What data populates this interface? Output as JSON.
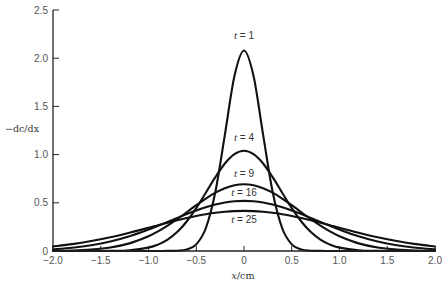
{
  "chart_data": {
    "type": "line",
    "title": "",
    "xlabel": "x/cm",
    "ylabel": "−dc/dx",
    "xlim": [
      -2.0,
      2.0
    ],
    "ylim": [
      0,
      2.5
    ],
    "grid": false,
    "legend": "none (curves labelled inline)",
    "x_ticks": [
      -2.0,
      -1.5,
      -1.0,
      -0.5,
      0,
      0.5,
      1.0,
      1.5,
      2.0
    ],
    "x_tick_labels": [
      "−2.0",
      "−1.5",
      "−1.0",
      "−0.5",
      "0",
      "0.5",
      "1.0",
      "1.5",
      "2.0"
    ],
    "y_ticks": [
      0,
      0.5,
      1.0,
      1.5,
      2.0,
      2.5
    ],
    "y_tick_labels": [
      "0",
      "0.5",
      "1.0",
      "1.5",
      "2.0",
      "2.5"
    ],
    "x": [
      -2.0,
      -1.8,
      -1.6,
      -1.4,
      -1.2,
      -1.0,
      -0.9,
      -0.8,
      -0.7,
      -0.6,
      -0.5,
      -0.4,
      -0.3,
      -0.2,
      -0.1,
      0.0,
      0.1,
      0.2,
      0.3,
      0.4,
      0.5,
      0.6,
      0.7,
      0.8,
      0.9,
      1.0,
      1.2,
      1.4,
      1.6,
      1.8,
      2.0
    ],
    "series": [
      {
        "name": "t = 1",
        "t": 1,
        "label_pos": [
          0.0,
          2.2
        ],
        "values": [
          0,
          0,
          0,
          0,
          0,
          0,
          0,
          0.001,
          0.003,
          0.016,
          0.069,
          0.236,
          0.612,
          1.207,
          1.815,
          2.08,
          1.815,
          1.207,
          0.612,
          0.236,
          0.069,
          0.016,
          0.003,
          0.001,
          0,
          0,
          0,
          0,
          0,
          0,
          0
        ]
      },
      {
        "name": "t = 4",
        "t": 4,
        "label_pos": [
          0.0,
          1.14
        ],
        "values": [
          0,
          0,
          0,
          0.001,
          0.008,
          0.035,
          0.066,
          0.118,
          0.196,
          0.306,
          0.444,
          0.604,
          0.766,
          0.908,
          1.005,
          1.04,
          1.005,
          0.908,
          0.766,
          0.604,
          0.444,
          0.306,
          0.196,
          0.118,
          0.066,
          0.035,
          0.008,
          0.001,
          0,
          0,
          0
        ]
      },
      {
        "name": "t = 9",
        "t": 9,
        "label_pos": [
          0.0,
          0.77
        ],
        "values": [
          0.002,
          0.005,
          0.015,
          0.036,
          0.079,
          0.153,
          0.204,
          0.263,
          0.33,
          0.402,
          0.475,
          0.544,
          0.605,
          0.652,
          0.683,
          0.693,
          0.683,
          0.652,
          0.605,
          0.544,
          0.475,
          0.402,
          0.33,
          0.263,
          0.204,
          0.153,
          0.079,
          0.036,
          0.015,
          0.005,
          0.002
        ]
      },
      {
        "name": "t = 16",
        "t": 16,
        "label_pos": [
          0.0,
          0.57
        ],
        "values": [
          0.017,
          0.033,
          0.059,
          0.098,
          0.153,
          0.222,
          0.261,
          0.302,
          0.343,
          0.383,
          0.42,
          0.454,
          0.482,
          0.503,
          0.516,
          0.52,
          0.516,
          0.503,
          0.482,
          0.454,
          0.42,
          0.383,
          0.343,
          0.302,
          0.261,
          0.222,
          0.153,
          0.098,
          0.059,
          0.033,
          0.017
        ]
      },
      {
        "name": "t = 25",
        "t": 25,
        "label_pos": [
          0.0,
          0.29
        ],
        "values": [
          0.047,
          0.071,
          0.103,
          0.143,
          0.19,
          0.241,
          0.268,
          0.294,
          0.319,
          0.342,
          0.363,
          0.381,
          0.396,
          0.407,
          0.414,
          0.416,
          0.414,
          0.407,
          0.396,
          0.381,
          0.363,
          0.342,
          0.319,
          0.294,
          0.268,
          0.241,
          0.19,
          0.143,
          0.103,
          0.071,
          0.047
        ]
      }
    ]
  },
  "labels": {
    "ylabel": "−dc/dx",
    "xlabel_var": "x",
    "xlabel_unit": "/cm"
  },
  "colors": {
    "curve": "#111111",
    "axis": "#222222",
    "tick_text": "#555555"
  }
}
